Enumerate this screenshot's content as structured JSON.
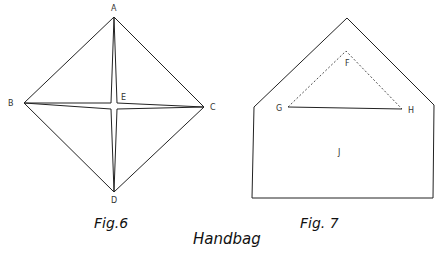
{
  "title": "Handbag",
  "figures": [
    {
      "caption": "Fig.6",
      "points": {
        "A": {
          "label": "A"
        },
        "B": {
          "label": "B"
        },
        "C": {
          "label": "C"
        },
        "D": {
          "label": "D"
        },
        "E": {
          "label": "E"
        }
      }
    },
    {
      "caption": "Fig. 7",
      "points": {
        "F": {
          "label": "F"
        },
        "G": {
          "label": "G"
        },
        "H": {
          "label": "H"
        },
        "J": {
          "label": "J"
        }
      }
    }
  ],
  "colors": {
    "line": "#222222",
    "background": "#ffffff"
  }
}
